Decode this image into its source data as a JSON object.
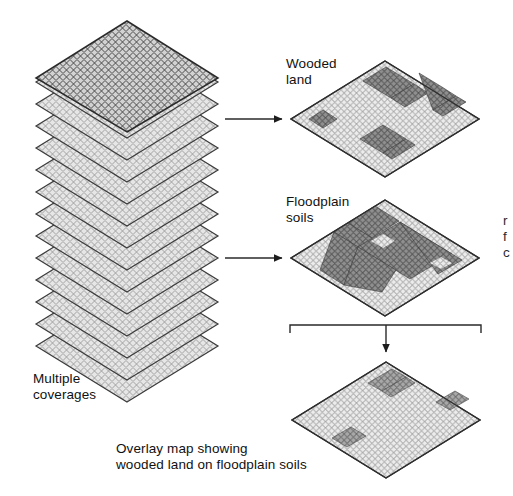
{
  "figure": {
    "title_hidden": "",
    "domain": "Diagram"
  },
  "labels": {
    "wooded_land": "Wooded\nland",
    "floodplain_soils": "Floodplain\nsoils",
    "multiple_coverages": "Multiple\ncoverages",
    "overlay_caption": "Overlay map showing\nwooded land on floodplain soils",
    "clipped_margin_text": "r\nf\nc"
  },
  "stack": {
    "name": "multiple-coverages-stack",
    "layer_count": 14,
    "top_layer_shaded": true,
    "layer_spacing_px": 22,
    "diamond_width_px": 182,
    "diamond_height_px": 112
  },
  "maps": [
    {
      "id": "wooded-land-map",
      "name": "Wooded land",
      "grid_cols": 20,
      "grid_rows": 20,
      "fill_shade": "#d9d9d9",
      "patch_shade": "#8a8a8a",
      "patches": [
        {
          "col": 2,
          "row": 8,
          "w": 3,
          "h": 2
        },
        {
          "col": 8,
          "row": 1,
          "w": 5,
          "h": 4
        },
        {
          "col": 14,
          "row": 2,
          "w": 4,
          "h": 3
        },
        {
          "col": 9,
          "row": 12,
          "w": 5,
          "h": 4
        }
      ]
    },
    {
      "id": "floodplain-soils-map",
      "name": "Floodplain soils",
      "grid_cols": 20,
      "grid_rows": 20,
      "fill_shade": "#d9d9d9",
      "patch_shade": "#8a8a8a",
      "patches": [
        {
          "col": 7,
          "row": 0,
          "w": 4,
          "h": 7
        },
        {
          "col": 4,
          "row": 7,
          "w": 14,
          "h": 4
        },
        {
          "col": 3,
          "row": 10,
          "w": 6,
          "h": 4
        },
        {
          "col": 13,
          "row": 5,
          "w": 6,
          "h": 4
        }
      ]
    },
    {
      "id": "overlay-map",
      "name": "Overlay map",
      "grid_cols": 20,
      "grid_rows": 20,
      "fill_shade": "#e4e4e4",
      "patch_shade": "#9a9a9a",
      "patches": [
        {
          "col": 8,
          "row": 1,
          "w": 3,
          "h": 4
        },
        {
          "col": 16,
          "row": 4,
          "w": 3,
          "h": 2
        },
        {
          "col": 5,
          "row": 12,
          "w": 3,
          "h": 2
        }
      ]
    }
  ],
  "connectors": [
    {
      "id": "arrow-stack-to-wooded",
      "type": "arrow",
      "direction": "right"
    },
    {
      "id": "arrow-stack-to-floodplain",
      "type": "arrow",
      "direction": "right"
    },
    {
      "id": "bracket-combine",
      "type": "bracket",
      "direction": "down"
    },
    {
      "id": "arrow-bracket-to-overlay",
      "type": "arrow",
      "direction": "down"
    }
  ],
  "colors": {
    "ink": "#111111",
    "grid_line": "#8d8d8d",
    "grid_line_dark": "#3a3a3a",
    "outline": "#2f2f2f",
    "background": "#ffffff"
  }
}
